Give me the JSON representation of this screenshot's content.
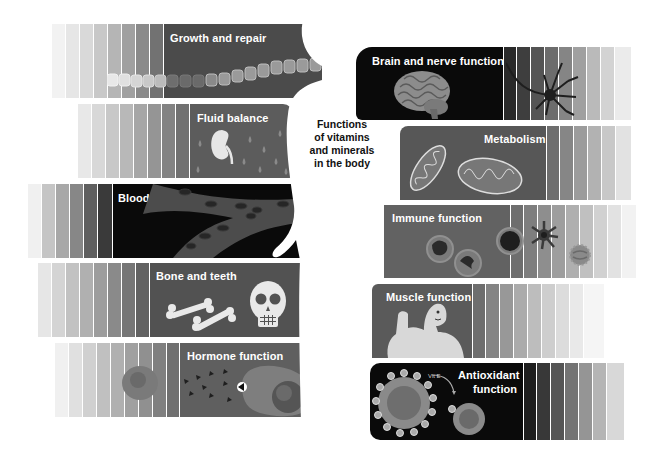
{
  "title": {
    "lines": [
      "Functions",
      "of vitamins",
      "and minerals",
      "in the body"
    ]
  },
  "functions_left": [
    {
      "label": "Growth and repair",
      "icon": "cell-chain-icon",
      "color": "#4b4b4b"
    },
    {
      "label": "Fluid balance",
      "icon": "kidney-icon",
      "color": "#5c5c5c"
    },
    {
      "label": "Blood",
      "icon": "blood-vessel-icon",
      "color": "#0a0a0a"
    },
    {
      "label": "Bone and teeth",
      "icon": "skull-bones-icon",
      "color": "#525252"
    },
    {
      "label": "Hormone function",
      "icon": "hormone-cell-icon",
      "color": "#5f5f5f"
    }
  ],
  "functions_right": [
    {
      "label": "Brain and nerve function",
      "icon": "brain-neuron-icon",
      "color": "#0a0a0a"
    },
    {
      "label": "Metabolism",
      "icon": "mitochondria-icon",
      "color": "#575757"
    },
    {
      "label": "Immune function",
      "icon": "immune-cells-icon",
      "color": "#626262"
    },
    {
      "label": "Muscle function",
      "icon": "muscle-man-icon",
      "color": "#5a5a5a"
    },
    {
      "label": "Antioxidant function",
      "label_lines": [
        "Antioxidant",
        "function"
      ],
      "icon": "antioxidant-cell-icon",
      "color": "#0a0a0a"
    }
  ]
}
